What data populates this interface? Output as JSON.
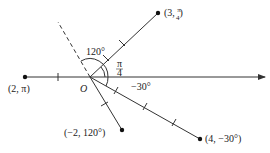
{
  "diagram": {
    "origin_label": "O",
    "points": [
      {
        "label": "(3, π/4)",
        "r": 3,
        "theta": "π/4",
        "label_prefix": "(3, ",
        "label_frac_num": "π",
        "label_frac_den": "4",
        "label_suffix": ")"
      },
      {
        "label": "(2, π)",
        "r": 2,
        "theta": "π"
      },
      {
        "label": "(−2, 120°)",
        "r": -2,
        "theta": "120°"
      },
      {
        "label": "(4, −30°)",
        "r": 4,
        "theta": "−30°"
      }
    ],
    "angles": [
      {
        "label": "120°"
      },
      {
        "label_num": "π",
        "label_den": "4"
      },
      {
        "label": "−30°"
      }
    ],
    "colors": {
      "line": "#333333",
      "point": "#111111"
    }
  }
}
